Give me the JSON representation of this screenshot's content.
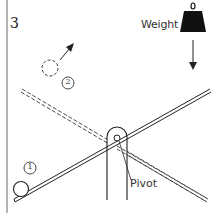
{
  "figure": {
    "number": "3",
    "labels": {
      "weight": "Weight",
      "pivot": "Pivot",
      "position_1": "1",
      "position_2": "2"
    },
    "elements": [
      {
        "id": "lever-current",
        "style": "solid double line",
        "description": "Lever tilted with ball end down"
      },
      {
        "id": "lever-next",
        "style": "dashed double line",
        "description": "Lever tilted other way after weight drops"
      },
      {
        "id": "pivot-post",
        "description": "Upright post holding the pivot"
      },
      {
        "id": "weight",
        "description": "Heavy weight with hook, falling downward"
      },
      {
        "id": "ball-1",
        "description": "Ball resting at low end of lever (position 1)"
      },
      {
        "id": "ball-2",
        "description": "Ball launched into the air (position 2, dashed)"
      }
    ],
    "colors": {
      "line": "#222222",
      "weight_fill": "#111111",
      "background": "#ffffff",
      "border": "#999999"
    }
  }
}
